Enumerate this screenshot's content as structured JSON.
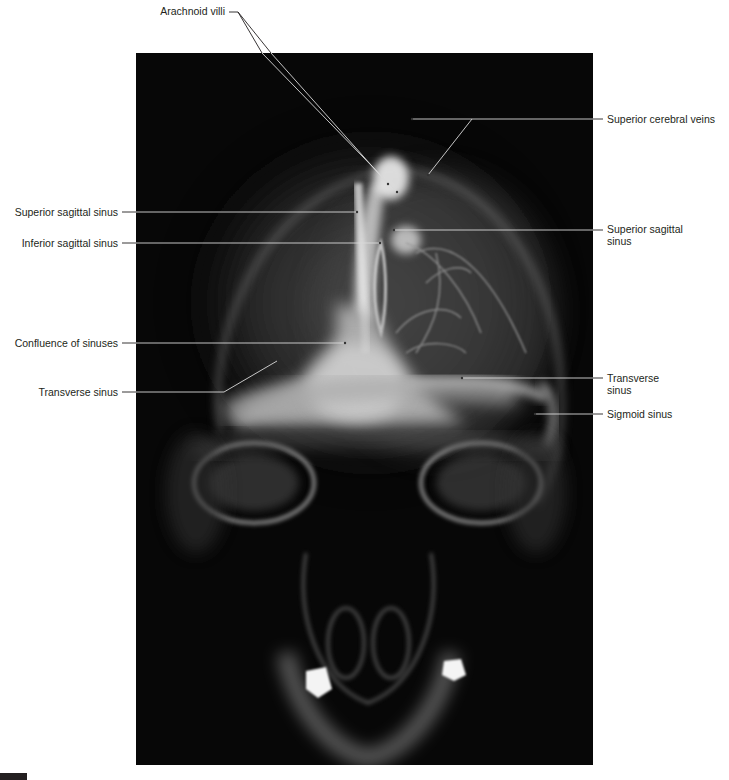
{
  "figure": {
    "type": "Skull radiograph (venous phase angiogram), frontal view",
    "image_region": {
      "x": 136,
      "y": 53,
      "width": 457,
      "height": 712
    },
    "colors": {
      "background": "#ffffff",
      "xray_background": "#070707",
      "label_text": "#231f20",
      "leader_line_outside": "#231f20",
      "leader_line_inside": "#d9d9d9"
    }
  },
  "labels": {
    "arachnoid_villi": "Arachnoid villi",
    "superior_cerebral_veins": "Superior cerebral veins",
    "superior_sagittal_sinus_left": "Superior sagittal sinus",
    "inferior_sagittal_sinus": "Inferior sagittal sinus",
    "superior_sagittal_sinus_right_line1": "Superior sagittal",
    "superior_sagittal_sinus_right_line2": "sinus",
    "confluence_of_sinuses": "Confluence of sinuses",
    "transverse_sinus_left": "Transverse sinus",
    "transverse_sinus_right_line1": "Transverse",
    "transverse_sinus_right_line2": "sinus",
    "sigmoid_sinus": "Sigmoid sinus"
  },
  "caption": {
    "visible": "partially clipped at bottom edge",
    "text": ""
  }
}
